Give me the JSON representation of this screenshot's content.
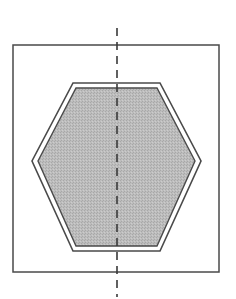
{
  "diagram": {
    "colors": {
      "background": "#ffffff",
      "stroke": "#4a4a4a",
      "hexagon_fill": "#b8b8b8",
      "axis": "#3a3a3a"
    },
    "rectangle": {
      "x": 13,
      "y": 45,
      "width": 206,
      "height": 227
    },
    "hexagon": {
      "outer_points": "73,83 160,83 201,161 160,251 73,251 32,161",
      "inner_points": "76,88 157,88 195,161 157,246 76,246 38,161"
    },
    "axis": {
      "x": 117,
      "y1": 28,
      "y2": 297,
      "dash": "8,6"
    }
  }
}
